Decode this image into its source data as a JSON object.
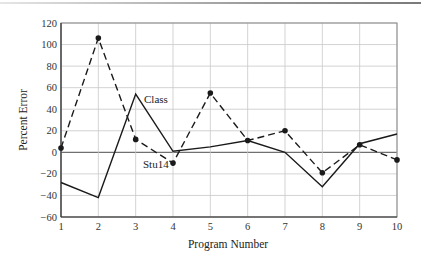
{
  "chart_data": {
    "type": "line",
    "title": "",
    "xlabel": "Program Number",
    "ylabel": "Percent  Error",
    "x": [
      1,
      2,
      3,
      4,
      5,
      6,
      7,
      8,
      9,
      10
    ],
    "xticks": [
      "1",
      "2",
      "3",
      "4",
      "5",
      "6",
      "7",
      "8",
      "9",
      "10"
    ],
    "yticks": [
      "120",
      "100",
      "80",
      "60",
      "40",
      "20",
      "0",
      "−20",
      "−40",
      "−60"
    ],
    "xlim": [
      1,
      10
    ],
    "ylim": [
      -60,
      120
    ],
    "grid": true,
    "legend": "none (inline annotations)",
    "series": [
      {
        "name": "Class",
        "style": "solid",
        "markers": false,
        "color": "#1a1a1a",
        "values": [
          -28,
          -42,
          54,
          1,
          5,
          11,
          0,
          -32,
          8,
          17
        ]
      },
      {
        "name": "Stu14",
        "style": "dashed",
        "markers": true,
        "color": "#1a1a1a",
        "values": [
          4,
          106,
          12,
          -10,
          55,
          11,
          20,
          -19,
          7,
          -7
        ]
      }
    ],
    "annotations": [
      {
        "text": "Class",
        "near_x": 3,
        "near_y": 40
      },
      {
        "text": "Stu14",
        "near_x": 3.5,
        "near_y": -17
      }
    ]
  },
  "labels": {
    "xlabel": "Program Number",
    "ylabel": "Percent  Error",
    "class_annotation": "Class",
    "stu_annotation": "Stu14"
  },
  "colors": {
    "grid": "#c8c8c8",
    "zero_line": "#707070",
    "frame": "#888888",
    "lines": "#1a1a1a"
  }
}
